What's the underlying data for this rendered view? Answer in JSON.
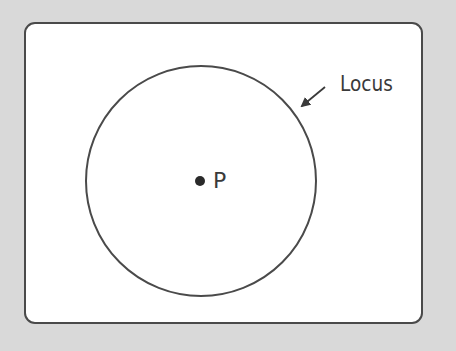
{
  "diagram": {
    "type": "geometry-locus",
    "labels": {
      "locus": "Locus",
      "point": "P"
    },
    "shapes": {
      "frame": {
        "x": 24,
        "y": 22,
        "width": 397,
        "height": 300,
        "corner_radius": 11
      },
      "circle": {
        "cx": 201,
        "cy": 181,
        "r": 115
      },
      "center_point": {
        "cx": 200,
        "cy": 181,
        "r": 5
      },
      "arrow": {
        "x1": 325,
        "y1": 87,
        "x2": 301,
        "y2": 107
      }
    },
    "colors": {
      "background": "#d9d9d9",
      "panel": "#ffffff",
      "stroke": "#4a4a4a",
      "text": "#3a3a3a"
    }
  }
}
